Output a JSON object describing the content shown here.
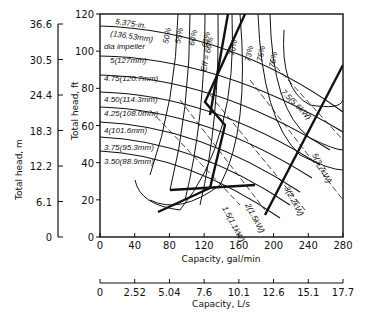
{
  "chart_data": {
    "type": "line",
    "title": "",
    "xlabel": "Capacity, gal/min",
    "x2label": "Capacity, L/s",
    "ylabel": "Total head, ft",
    "y2label": "Total head, m",
    "xlim": [
      0,
      280
    ],
    "ylim": [
      0,
      120
    ],
    "x_ticks": [
      "0",
      "40",
      "80",
      "120",
      "160",
      "200",
      "240",
      "280"
    ],
    "x2_ticks": [
      "0",
      "2.52",
      "5.04",
      "7.6",
      "10.1",
      "12.6",
      "15.1",
      "17.7"
    ],
    "y_ticks": [
      "0",
      "20",
      "40",
      "60",
      "80",
      "100",
      "120"
    ],
    "y2_ticks": [
      "0",
      "6.1",
      "12.2",
      "18.3",
      "24.4",
      "30.5",
      "36.6"
    ],
    "grid": false,
    "impeller_curves": [
      {
        "label": "5.375-in. (136.53mm) dia impeller",
        "points": [
          [
            0,
            112
          ],
          [
            80,
            110
          ],
          [
            160,
            103
          ],
          [
            240,
            90
          ],
          [
            280,
            80
          ]
        ]
      },
      {
        "label": "5(127mm)",
        "points": [
          [
            0,
            96
          ],
          [
            80,
            94
          ],
          [
            160,
            87
          ],
          [
            240,
            73
          ],
          [
            280,
            62
          ]
        ]
      },
      {
        "label": "4.75(120.7mm)",
        "points": [
          [
            0,
            86
          ],
          [
            80,
            84
          ],
          [
            160,
            77
          ],
          [
            240,
            62
          ],
          [
            270,
            52
          ]
        ]
      },
      {
        "label": "4.50(114.3mm)",
        "points": [
          [
            0,
            77
          ],
          [
            80,
            75
          ],
          [
            160,
            67
          ],
          [
            230,
            52
          ],
          [
            260,
            42
          ]
        ]
      },
      {
        "label": "4.25(108.0mm)",
        "points": [
          [
            0,
            69
          ],
          [
            80,
            67
          ],
          [
            160,
            59
          ],
          [
            220,
            44
          ],
          [
            250,
            34
          ]
        ]
      },
      {
        "label": "4(101.6mm)",
        "points": [
          [
            0,
            61
          ],
          [
            80,
            59
          ],
          [
            150,
            51
          ],
          [
            210,
            37
          ],
          [
            240,
            27
          ]
        ]
      },
      {
        "label": "3.75(95.3mm)",
        "points": [
          [
            0,
            53
          ],
          [
            80,
            51
          ],
          [
            150,
            43
          ],
          [
            200,
            31
          ],
          [
            230,
            20
          ]
        ]
      },
      {
        "label": "3.50(88.9mm)",
        "points": [
          [
            0,
            46
          ],
          [
            80,
            44
          ],
          [
            140,
            37
          ],
          [
            190,
            25
          ],
          [
            220,
            13
          ]
        ]
      }
    ],
    "efficiency_labels": [
      "50%",
      "55%",
      "60%",
      "63%",
      "Eff = 66%",
      "70%",
      "73%",
      "75%",
      "76%"
    ],
    "power_labels": [
      "1.5(1.1kW)",
      "2(1.5kW)",
      "3(2.2kW)",
      "5(3.7kW)",
      "7.5(5.6kW)"
    ],
    "legend": "none"
  },
  "labels": {
    "impeller_top_1": "5.375-in.",
    "impeller_top_2": "(136.53mm)",
    "impeller_top_3": "dia impeller",
    "imp_5": "5(127mm)",
    "imp_475": "4.75(120.7mm)",
    "imp_450": "4.50(114.3mm)",
    "imp_425": "4.25(108.0mm)",
    "imp_4": "4(101.6mm)",
    "imp_375": "3.75(95.3mm)",
    "imp_350": "3.50(88.9mm)",
    "eff_50": "50%",
    "eff_55": "55%",
    "eff_60": "60%",
    "eff_63": "63%",
    "eff_66": "Eff = 66%",
    "eff_70": "70%",
    "eff_73": "73%",
    "eff_75": "75%",
    "eff_76": "76%",
    "pw_15": "1.5(1.1kW)",
    "pw_2": "2(1.5kW)",
    "pw_3": "3(2.2kW)",
    "pw_5": "5(3.7kW)",
    "pw_75": "7.5(5.6kW)"
  }
}
